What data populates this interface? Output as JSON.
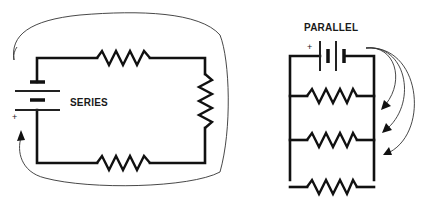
{
  "diagram": {
    "series": {
      "title": "SERIES",
      "battery_polarity_label": "+",
      "resistor_count": 3,
      "components": [
        "battery",
        "resistor-top",
        "resistor-right",
        "resistor-bottom"
      ],
      "current_flow": "single loop arrow around the circuit returning to battery + terminal"
    },
    "parallel": {
      "title": "PARALLEL",
      "battery_polarity_label": "+",
      "resistor_count": 3,
      "components": [
        "battery",
        "resistor-branch-1",
        "resistor-branch-2",
        "resistor-branch-3"
      ],
      "current_flow": "three arrows branching from battery to each resistor branch"
    },
    "colors": {
      "background": "#ffffff",
      "line": "#111111",
      "arrow": "#333333"
    }
  }
}
